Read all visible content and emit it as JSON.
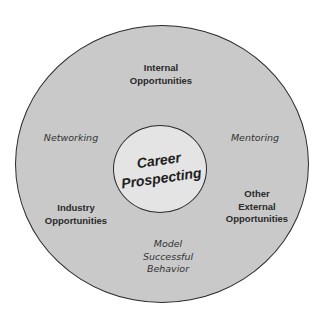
{
  "diagram": {
    "type": "concentric-circle",
    "center": {
      "lines": [
        "Career",
        "Prospecting"
      ]
    },
    "items": [
      {
        "id": "internal-opportunities",
        "lines": [
          "Internal",
          "Opportunities"
        ],
        "style": "bold",
        "position": "top"
      },
      {
        "id": "networking",
        "lines": [
          "Networking"
        ],
        "style": "hand",
        "position": "left"
      },
      {
        "id": "mentoring",
        "lines": [
          "Mentoring"
        ],
        "style": "hand",
        "position": "right"
      },
      {
        "id": "industry-opportunities",
        "lines": [
          "Industry",
          "Opportunities"
        ],
        "style": "bold",
        "position": "bottom-left"
      },
      {
        "id": "other-external-opportunities",
        "lines": [
          "Other",
          "External",
          "Opportunities"
        ],
        "style": "bold",
        "position": "bottom-right"
      },
      {
        "id": "model-successful-behavior",
        "lines": [
          "Model",
          "Successful",
          "Behavior"
        ],
        "style": "hand",
        "position": "bottom"
      }
    ],
    "colors": {
      "outer_fill": "#c9c9c9",
      "inner_fill": "#e4e4e4",
      "stroke": "#2a2a2a",
      "text": "#2a2a2a"
    }
  }
}
